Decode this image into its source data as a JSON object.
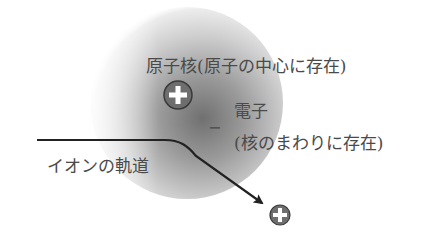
{
  "diagram": {
    "nucleus_label": "原子核(原子の中心に存在)",
    "electron_label": "電子",
    "electron_sublabel": "(核のまわりに存在)",
    "electron_symbol": "−",
    "trajectory_label": "イオンの軌道",
    "nucleus_charge": "positive",
    "ion_charge": "positive"
  },
  "colors": {
    "cloud_center": "#6f6f6f",
    "cloud_edge": "#ffffff",
    "line": "#222222",
    "particle_fill": "#6e6e6e",
    "particle_border": "#3a3a3a",
    "plus_sign": "#ffffff",
    "text": "#4a4a4a"
  }
}
